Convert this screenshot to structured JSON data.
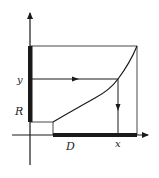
{
  "diagram": {
    "type": "function-mapping",
    "labels": {
      "y_value": "y",
      "range": "R",
      "domain": "D",
      "x_value": "x"
    },
    "geometry": {
      "origin": [
        30,
        135
      ],
      "y_axis_top": 12,
      "y_axis_bottom": 165,
      "x_axis_left": 12,
      "x_axis_right": 148,
      "box_top": 46,
      "box_right": 137,
      "domain_start_x": 53,
      "range_bottom_y": 122,
      "sample_x": 118,
      "sample_y": 79
    },
    "colors": {
      "ink": "#1a1a1a",
      "background": "#ffffff"
    }
  }
}
